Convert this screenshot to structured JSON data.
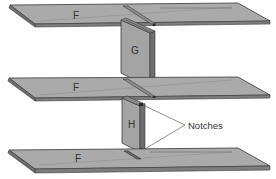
{
  "diagram": {
    "shelves": [
      {
        "id": "top",
        "label": "F"
      },
      {
        "id": "middle",
        "label": "F"
      },
      {
        "id": "bottom",
        "label": "F"
      }
    ],
    "panels": [
      {
        "id": "upper",
        "label": "G"
      },
      {
        "id": "lower",
        "label": "H"
      }
    ],
    "callout": {
      "label": "Notches"
    },
    "colors": {
      "shelf_top": "#a9a9a9",
      "shelf_edge": "#7d7d7d",
      "panel_face": "#a4a4a4",
      "panel_side": "#6e6e6e",
      "outline": "#3a3a3a",
      "text": "#333333",
      "background": "#ffffff"
    }
  }
}
